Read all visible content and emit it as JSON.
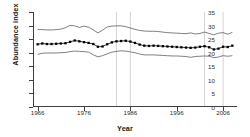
{
  "chart_data": {
    "type": "line",
    "title": "",
    "xlabel": "Year",
    "ylabel": "Abundance index",
    "xlim": [
      1965,
      2009
    ],
    "ylim": [
      0,
      35
    ],
    "xticks": [
      1966,
      1976,
      1986,
      1996,
      2006
    ],
    "yticks": [
      0,
      5,
      10,
      15,
      20,
      25,
      30,
      35
    ],
    "grid": false,
    "legend": "none",
    "x": [
      1966,
      1967,
      1968,
      1969,
      1970,
      1971,
      1972,
      1973,
      1974,
      1975,
      1976,
      1977,
      1978,
      1979,
      1980,
      1981,
      1982,
      1983,
      1984,
      1985,
      1986,
      1987,
      1988,
      1989,
      1990,
      1991,
      1992,
      1993,
      1994,
      1995,
      1996,
      1997,
      1998,
      1999,
      2000,
      2001,
      2002,
      2003,
      2004,
      2005,
      2006,
      2007,
      2008
    ],
    "series": [
      {
        "name": "Abundance index",
        "marker": "square",
        "values": [
          23.1,
          23.4,
          23.2,
          23.2,
          23.3,
          23.4,
          23.5,
          24.0,
          24.5,
          24.2,
          23.9,
          23.6,
          23.2,
          22.2,
          22.3,
          23.1,
          23.8,
          24.2,
          24.3,
          24.4,
          24.1,
          23.6,
          23.0,
          22.6,
          22.5,
          22.6,
          22.5,
          22.4,
          22.3,
          22.2,
          22.1,
          22.0,
          21.9,
          21.8,
          21.9,
          22.2,
          22.4,
          22.0,
          21.2,
          21.5,
          22.2,
          22.1,
          22.6
        ]
      },
      {
        "name": "Upper confidence limit",
        "marker": "none",
        "values": [
          28.6,
          28.5,
          28.4,
          28.4,
          28.5,
          28.7,
          29.2,
          30.1,
          29.9,
          29.3,
          29.8,
          29.4,
          28.4,
          27.3,
          28.3,
          29.5,
          29.8,
          29.9,
          29.9,
          29.6,
          29.1,
          28.6,
          28.2,
          28.0,
          27.9,
          27.9,
          27.8,
          27.6,
          27.4,
          27.3,
          27.2,
          27.1,
          27.0,
          27.3,
          26.9,
          27.1,
          27.6,
          27.1,
          26.6,
          27.2,
          27.4,
          26.8,
          27.5
        ]
      },
      {
        "name": "Lower confidence limit",
        "marker": "none",
        "values": [
          19.4,
          19.8,
          19.9,
          19.9,
          19.9,
          20.0,
          20.1,
          20.4,
          20.6,
          20.5,
          20.4,
          20.2,
          19.2,
          18.5,
          18.9,
          19.6,
          20.2,
          20.5,
          20.7,
          20.6,
          20.3,
          20.0,
          19.5,
          19.2,
          19.2,
          19.2,
          19.1,
          19.0,
          18.9,
          18.8,
          18.8,
          18.7,
          18.6,
          18.3,
          18.6,
          18.7,
          18.8,
          18.7,
          18.2,
          18.4,
          18.9,
          18.7,
          18.9
        ]
      }
    ],
    "reference_lines": [
      1983,
      1986,
      2002,
      2006
    ],
    "colors": {
      "marker": "#000000",
      "line": "#1a1a1a",
      "band": "#4a4a4a",
      "axis": "#404040",
      "reference": "#c8c8c8",
      "text": "#2b2b2b"
    }
  }
}
